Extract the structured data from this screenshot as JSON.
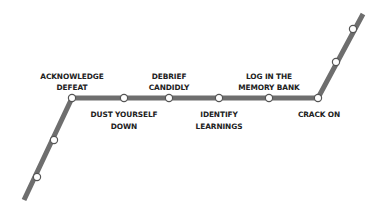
{
  "diagram": {
    "type": "metro-line",
    "colors": {
      "line": "#6e6e6e",
      "station_fill": "#ffffff",
      "station_stroke": "#555555",
      "label": "#222222",
      "background": "#ffffff"
    },
    "stations": [
      {
        "id": "s1",
        "label_lines": [],
        "x": 37,
        "y": 177
      },
      {
        "id": "s2",
        "label_lines": [],
        "x": 54,
        "y": 140
      },
      {
        "id": "acknowledge-defeat",
        "label_lines": [
          "ACKNOWLEDGE",
          "DEFEAT"
        ],
        "label_position": "above",
        "x": 72,
        "y": 98
      },
      {
        "id": "dust-yourself-down",
        "label_lines": [
          "DUST YOURSELF",
          "DOWN"
        ],
        "label_position": "below",
        "x": 124,
        "y": 98
      },
      {
        "id": "debrief-candidly",
        "label_lines": [
          "DEBRIEF",
          "CANDIDLY"
        ],
        "label_position": "above",
        "x": 169,
        "y": 98
      },
      {
        "id": "identify-learnings",
        "label_lines": [
          "IDENTIFY",
          "LEARNINGS"
        ],
        "label_position": "below",
        "x": 219,
        "y": 98
      },
      {
        "id": "log-in-memory-bank",
        "label_lines": [
          "LOG IN THE",
          "MEMORY BANK"
        ],
        "label_position": "above",
        "x": 269,
        "y": 98
      },
      {
        "id": "crack-on",
        "label_lines": [
          "CRACK ON"
        ],
        "label_position": "below",
        "x": 318,
        "y": 98
      },
      {
        "id": "s9",
        "label_lines": [],
        "x": 336,
        "y": 62
      },
      {
        "id": "s10",
        "label_lines": [],
        "x": 353,
        "y": 29
      }
    ],
    "labels": {
      "acknowledge_defeat_1": "ACKNOWLEDGE",
      "acknowledge_defeat_2": "DEFEAT",
      "dust_yourself_down_1": "DUST YOURSELF",
      "dust_yourself_down_2": "DOWN",
      "debrief_candidly_1": "DEBRIEF",
      "debrief_candidly_2": "CANDIDLY",
      "identify_learnings_1": "IDENTIFY",
      "identify_learnings_2": "LEARNINGS",
      "log_in_memory_bank_1": "LOG IN THE",
      "log_in_memory_bank_2": "MEMORY BANK",
      "crack_on_1": "CRACK ON"
    }
  }
}
